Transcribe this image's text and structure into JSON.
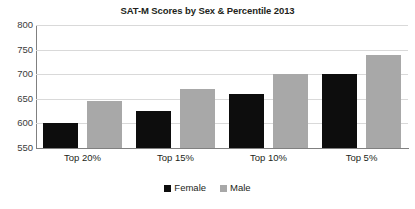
{
  "chart_data": {
    "type": "bar",
    "title": "SAT-M Scores by Sex & Percentile 2013",
    "xlabel": "",
    "ylabel": "",
    "categories": [
      "Top 20%",
      "Top 15%",
      "Top 10%",
      "Top 5%"
    ],
    "series": [
      {
        "name": "Female",
        "color": "#0d0d0d",
        "values": [
          600,
          625,
          660,
          700
        ]
      },
      {
        "name": "Male",
        "color": "#a8a8a8",
        "values": [
          645,
          670,
          700,
          740
        ]
      }
    ],
    "ylim": [
      550,
      800
    ],
    "ytick_labels": [
      "800",
      "750",
      "700",
      "650",
      "600",
      "550"
    ],
    "ytick_values": [
      800,
      750,
      700,
      650,
      600,
      550
    ],
    "grid": true,
    "legend_position": "bottom"
  },
  "legend": {
    "items": [
      {
        "label": "Female"
      },
      {
        "label": "Male"
      }
    ]
  }
}
